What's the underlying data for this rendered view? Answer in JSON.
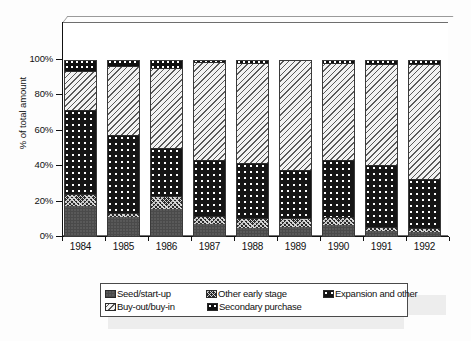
{
  "chart_data": {
    "type": "bar",
    "subtype": "stacked-percentage-column",
    "title": "",
    "xlabel": "",
    "ylabel": "% of total amount",
    "ylim": [
      0,
      100
    ],
    "yticks": [
      "0%",
      "20%",
      "40%",
      "60%",
      "80%",
      "100%"
    ],
    "ytick_values": [
      0,
      20,
      40,
      60,
      80,
      100
    ],
    "grid": false,
    "legend_position": "bottom",
    "categories": [
      "1984",
      "1985",
      "1986",
      "1987",
      "1988",
      "1989",
      "1990",
      "1991",
      "1992"
    ],
    "stack_order_bottom_to_top": [
      "Seed/start-up",
      "Other early stage",
      "Expansion and other",
      "Buy-out/buy-in",
      "Secondary purchase"
    ],
    "series": [
      {
        "name": "Seed/start-up",
        "pattern": "dark-grey-solid",
        "values": [
          17,
          11,
          15,
          7,
          4.5,
          5,
          6.5,
          3,
          2.5
        ]
      },
      {
        "name": "Other early stage",
        "pattern": "dark-cross-weave",
        "values": [
          7,
          2,
          7.5,
          4.5,
          5.5,
          5,
          4,
          2,
          2
        ]
      },
      {
        "name": "Expansion and other",
        "pattern": "black-white-dots",
        "values": [
          47,
          44,
          27.5,
          31.5,
          31,
          27.5,
          32.5,
          35,
          27.5
        ]
      },
      {
        "name": "Buy-out/buy-in",
        "pattern": "light-diagonal-hatch",
        "values": [
          22,
          39,
          45,
          55.5,
          57,
          62,
          54.5,
          57,
          65
        ]
      },
      {
        "name": "Secondary purchase",
        "pattern": "black-white-dots-coarse",
        "values": [
          7,
          4,
          5,
          1.5,
          2,
          0.5,
          2.5,
          3,
          3
        ]
      }
    ]
  },
  "legend": {
    "items": [
      {
        "label": "Seed/start-up",
        "pattern": "dark-grey-solid"
      },
      {
        "label": "Other early stage",
        "pattern": "dark-cross-weave"
      },
      {
        "label": "Expansion and other",
        "pattern": "black-white-dots"
      },
      {
        "label": "Buy-out/buy-in",
        "pattern": "light-diagonal-hatch"
      },
      {
        "label": "Secondary purchase",
        "pattern": "black-white-dots-coarse"
      }
    ]
  },
  "colors": {
    "seed": "#4a4a4a",
    "early": "#2a2a2a",
    "expansion": "#151515",
    "buyout": "#f2f2f2",
    "secondary": "#101010",
    "axis": "#111111",
    "frame": "#6e6e6e",
    "background": "#ffffff"
  }
}
